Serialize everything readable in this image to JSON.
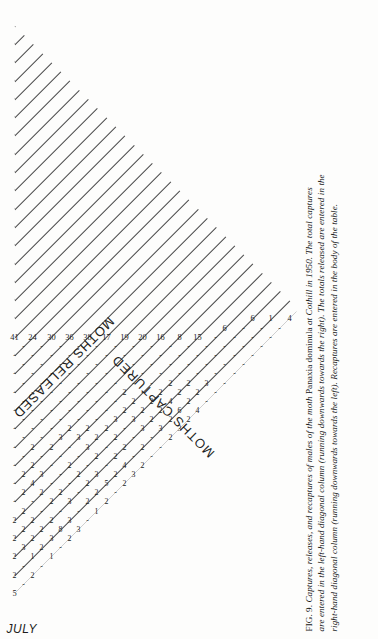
{
  "figure": {
    "number": "FIG. 9.",
    "caption_lines": [
      "FIG. 9. Captures, releases, and recaptures of males of the moth Panaxia dominula at Cothill in 1950. The total captures",
      "are entered in the left-hand diagonal column (running downwards towards the right). The totals released are entered in the",
      "right-hand diagonal column (running downwards towards the left). Recaptures are entered in the body of the table."
    ],
    "caption_runs": [
      [
        {
          "t": "FIG. 9. ",
          "style": "roman"
        },
        {
          "t": "Captures, releases, and recaptures of males of the moth ",
          "style": "italic"
        },
        {
          "t": "Panaxia dominula ",
          "style": "roman"
        },
        {
          "t": "at Cothill in 1950. The total captures",
          "style": "italic"
        }
      ],
      [
        {
          "t": "are entered in the left-hand diagonal column (running downwards towards the right). The totals released are entered in the",
          "style": "italic"
        }
      ],
      [
        {
          "t": "right-hand diagonal column (running downwards towards the left). Recaptures are entered in the body of the table.",
          "style": "italic"
        }
      ]
    ]
  },
  "axis": {
    "month_label": "JULY",
    "days": [
      "5",
      "6",
      "7",
      "8",
      "9",
      "10",
      "11",
      "12",
      "13",
      "14",
      "15",
      "16",
      "17",
      "18",
      "19",
      "20",
      "21",
      "22",
      "23",
      "24",
      "25",
      "26",
      "27",
      "28",
      "29",
      "30",
      "31",
      "1",
      "2",
      "3",
      "4"
    ]
  },
  "bands": {
    "captured_label": "MOTHS CAPTURED",
    "released_label": "MOTHS RELEASED"
  },
  "chart_data": {
    "type": "table",
    "xlabel": "JULY (day of capture)",
    "ylabel": "day of release",
    "grid": true,
    "legend": "none",
    "categories": [
      "5",
      "6",
      "7",
      "8",
      "9",
      "10",
      "11",
      "12",
      "13",
      "14",
      "15",
      "16",
      "17",
      "18",
      "19",
      "20",
      "21",
      "22",
      "23",
      "24",
      "25",
      "26",
      "27",
      "28",
      "29",
      "30",
      "31",
      "1",
      "2",
      "3",
      "4"
    ],
    "series": [
      {
        "name": "MOTHS CAPTURED",
        "values": [
          5,
          5,
          14,
          15,
          20,
          33,
          26,
          83,
          32,
          28,
          40,
          39,
          30,
          48,
          51,
          60,
          43,
          39,
          30,
          37,
          40,
          38,
          17,
          21,
          16,
          8,
          15,
          6,
          6,
          1,
          4
        ]
      },
      {
        "name": "MOTHS RELEASED",
        "values": [
          5,
          5,
          14,
          15,
          20,
          33,
          26,
          83,
          32,
          28,
          40,
          39,
          30,
          48,
          51,
          60,
          43,
          39,
          30,
          37,
          40,
          38,
          17,
          21,
          16,
          8,
          15,
          6,
          6,
          1,
          4
        ]
      }
    ],
    "released_diagonal_top_down": [
      4,
      1,
      6,
      6,
      15,
      8,
      16,
      20,
      19,
      17,
      38,
      36,
      30,
      24,
      41,
      57,
      50,
      48,
      37,
      39,
      28,
      32,
      83,
      26,
      33,
      20,
      15,
      14,
      5,
      5
    ],
    "captured_diagonal_top_down": [
      4,
      5,
      5,
      14,
      15,
      20,
      33,
      26,
      83,
      32,
      28,
      40,
      39,
      30,
      48,
      51,
      60,
      43,
      39,
      30,
      37,
      40,
      38,
      17,
      21,
      16,
      8,
      15,
      6,
      6,
      1
    ],
    "recaptures_note": "Body cells hold recapture counts; most are 1-8 or a dash (no recaptures).",
    "body_rows": [
      {
        "day": "5",
        "cells": [
          "5",
          "-",
          "2",
          "-",
          "1",
          "-",
          "2",
          "3",
          "-",
          "1",
          "2",
          "-",
          "2",
          "3",
          "2",
          "-",
          "-",
          "2",
          "3",
          "2",
          "4",
          "-",
          "-",
          "-",
          "-",
          "-",
          "-",
          "-",
          "-",
          "-"
        ]
      },
      {
        "day": "6",
        "cells": [
          "5",
          "2",
          "-",
          "1",
          "2",
          "3",
          "8",
          "3",
          "-",
          "2",
          "2",
          "5",
          "2",
          "4",
          "-",
          "2",
          "-",
          "3",
          "2",
          "6",
          "2",
          "2",
          "3",
          "-",
          "-",
          "-",
          "-",
          "-",
          "-"
        ]
      },
      {
        "day": "7",
        "cells": [
          "14",
          "-",
          "2",
          "3",
          "2",
          "2",
          "2",
          "-",
          "3",
          "-",
          "2",
          "3",
          "-",
          "2",
          "2",
          "-",
          "3",
          "2",
          "2",
          "4",
          "2",
          "2",
          "-",
          "-",
          "-",
          "-",
          "-",
          "-"
        ]
      },
      {
        "day": "8",
        "cells": [
          "15",
          "2",
          "-",
          "2",
          "2",
          "2",
          "-",
          "2",
          "2",
          "-",
          "2",
          "-",
          "2",
          "-",
          "2",
          "-",
          "3",
          "2",
          "2",
          "2",
          "2",
          "-",
          "-",
          "-",
          "-",
          "-"
        ]
      },
      {
        "day": "9",
        "cells": [
          "20",
          "-",
          "2",
          "-",
          "2",
          "2",
          "-",
          "2",
          "-",
          "-",
          "2",
          "-",
          "3",
          "2",
          "2",
          "3",
          "2",
          "2",
          "-",
          "-",
          "-",
          "-",
          "-",
          "-"
        ]
      },
      {
        "day": "10",
        "cells": [
          "33",
          "-",
          "-",
          "-",
          "-",
          "-",
          "2",
          "4",
          "3",
          "-",
          "-",
          "-",
          "3",
          "2",
          "-",
          "-",
          "-",
          "2",
          "-",
          "-",
          "-",
          "-",
          "-"
        ]
      },
      {
        "day": "11",
        "cells": [
          "26",
          "-",
          "-",
          "-",
          "2",
          "7",
          "-",
          "2",
          "2",
          "-",
          "2",
          "3",
          "2",
          "-",
          "-",
          "-",
          "-",
          "-",
          "-",
          "-",
          "-",
          "-"
        ]
      },
      {
        "day": "12",
        "cells": [
          "83",
          "-",
          "-",
          "-",
          "4",
          "-",
          "2",
          "-",
          "-",
          "2",
          "-",
          "-",
          "-",
          "-",
          "-",
          "-",
          "-",
          "-",
          "-",
          "-",
          "-"
        ]
      },
      {
        "day": "13",
        "cells": [
          "32",
          "-",
          "2",
          "-",
          "-",
          "2",
          "-",
          "-",
          "-",
          "-",
          "-",
          "-",
          "-",
          "-",
          "-",
          "-",
          "-",
          "-",
          "-",
          "-"
        ]
      },
      {
        "day": "14",
        "cells": [
          "28",
          "-",
          "-",
          "-",
          "-",
          "-",
          "-",
          "-",
          "-",
          "-",
          "-",
          "-",
          "-",
          "-",
          "-",
          "-",
          "-",
          "-",
          "-"
        ]
      },
      {
        "day": "15",
        "cells": [
          "40",
          "-",
          "-",
          "-",
          "-",
          "-",
          "-",
          "-",
          "-",
          "-",
          "-",
          "-",
          "-",
          "-",
          "-",
          "-",
          "-",
          "-"
        ]
      },
      {
        "day": "16",
        "cells": [
          "39",
          "-",
          "-",
          "-",
          "-",
          "-",
          "-",
          "-",
          "-",
          "-",
          "-",
          "-",
          "-",
          "-",
          "-",
          "-",
          "-"
        ]
      },
      {
        "day": "17",
        "cells": [
          "30",
          "-",
          "-",
          "-",
          "-",
          "-",
          "-",
          "-",
          "-",
          "-",
          "-",
          "-",
          "-",
          "-",
          "-",
          "-"
        ]
      },
      {
        "day": "18",
        "cells": [
          "48",
          "-",
          "-",
          "-",
          "-",
          "-",
          "-",
          "-",
          "-",
          "-",
          "-",
          "-",
          "-",
          "-",
          "-"
        ]
      },
      {
        "day": "19",
        "cells": [
          "51",
          "-",
          "-",
          "-",
          "-",
          "-",
          "-",
          "-",
          "-",
          "-",
          "-",
          "-",
          "-",
          "-"
        ]
      },
      {
        "day": "20",
        "cells": [
          "60",
          "-",
          "-",
          "-",
          "-",
          "-",
          "-",
          "-",
          "-",
          "-",
          "-",
          "-",
          "-"
        ]
      },
      {
        "day": "21",
        "cells": [
          "43",
          "-",
          "-",
          "-",
          "-",
          "-",
          "-",
          "-",
          "-",
          "-",
          "-",
          "-"
        ]
      },
      {
        "day": "22",
        "cells": [
          "39",
          "-",
          "-",
          "-",
          "-",
          "-",
          "-",
          "-",
          "-",
          "-",
          "-"
        ]
      },
      {
        "day": "23",
        "cells": [
          "30",
          "-",
          "-",
          "-",
          "-",
          "-",
          "-",
          "-",
          "-",
          "-"
        ]
      },
      {
        "day": "24",
        "cells": [
          "37",
          "-",
          "-",
          "-",
          "-",
          "-",
          "-",
          "-",
          "-"
        ]
      },
      {
        "day": "25",
        "cells": [
          "40",
          "-",
          "-",
          "-",
          "-",
          "-",
          "-",
          "-"
        ]
      },
      {
        "day": "26",
        "cells": [
          "38",
          "-",
          "-",
          "-",
          "-",
          "-",
          "-"
        ]
      },
      {
        "day": "27",
        "cells": [
          "17",
          "-",
          "-",
          "-",
          "-",
          "-"
        ]
      },
      {
        "day": "28",
        "cells": [
          "21",
          "-",
          "-",
          "-",
          "-"
        ]
      },
      {
        "day": "29",
        "cells": [
          "16",
          "-",
          "-",
          "-"
        ]
      },
      {
        "day": "30",
        "cells": [
          "8",
          "-",
          "-"
        ]
      },
      {
        "day": "31",
        "cells": [
          "15",
          "-"
        ]
      },
      {
        "day": "1",
        "cells": [
          "6"
        ]
      },
      {
        "day": "2",
        "cells": [
          "6"
        ]
      },
      {
        "day": "3",
        "cells": [
          "1"
        ]
      },
      {
        "day": "4",
        "cells": [
          "4"
        ]
      }
    ]
  },
  "colors": {
    "ink": "#1a1a1a",
    "rule": "#4a4a4a",
    "heavy_rule": "#111111",
    "paper": "#fdfdfc"
  }
}
